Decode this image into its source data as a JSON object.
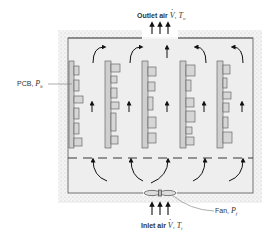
{
  "diagram": {
    "type": "electronics-enclosure-airflow-schematic",
    "labels": {
      "outlet": {
        "prefix": "Outlet air",
        "flow_symbol": "V",
        "temp_symbol": "T",
        "temp_subscript": "o"
      },
      "inlet": {
        "prefix": "Inlet air",
        "flow_symbol": "V",
        "temp_symbol": "T",
        "temp_subscript": "i"
      },
      "pcb": {
        "prefix": "PCB,",
        "symbol": "P",
        "subscript": "b"
      },
      "fan": {
        "prefix": "Fan,",
        "symbol": "P",
        "subscript": "f"
      }
    },
    "board_count": 5,
    "colors": {
      "enclosure_fill": "#eeeeee",
      "wall_stipple": "#d8d8d8",
      "board_fill": "#cfcfcf",
      "component_fill": "#d6d6d6",
      "stroke": "#444444",
      "arrow": "#111111"
    }
  }
}
